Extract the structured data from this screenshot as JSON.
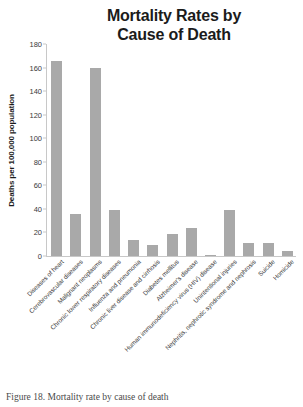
{
  "chart_data": {
    "type": "bar",
    "title": "Mortality Rates by Cause of Death",
    "title_line1": "Mortality Rates by",
    "title_line2": "Cause of Death",
    "xlabel": "",
    "ylabel": "Deaths per 100,000 population",
    "ylim": [
      0,
      180
    ],
    "ytick_step": 20,
    "yticks": [
      180,
      160,
      140,
      120,
      100,
      80,
      60,
      40,
      20,
      0
    ],
    "grid": false,
    "legend": false,
    "bar_color": "#a9a9a9",
    "categories": [
      "Diseases of heart",
      "Cerebrovascular diseases",
      "Malignant neoplasms",
      "Chronic lower respiratory diseases",
      "Influenza and pneumonia",
      "Chronic liver disease and cirrhosis",
      "Diabetes mellitus",
      "Alzheimer's disease",
      "Human immunodeficiency virus (HIV) disease",
      "Unintentional injuries",
      "Nephritis, nephrotic syndrome and nephrosis",
      "Suicide",
      "Homicide"
    ],
    "values": [
      166,
      36,
      160,
      39,
      14,
      9,
      19,
      24,
      1,
      39,
      11,
      11,
      4
    ]
  },
  "caption": {
    "label": "Figure 18.",
    "text": "Mortality rate by cause of death",
    "full": "Figure 18. Mortality rate by cause of death"
  }
}
